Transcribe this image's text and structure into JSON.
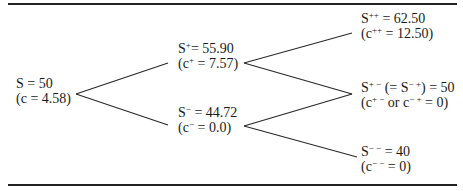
{
  "diagram": {
    "type": "binomial-tree",
    "nodes": [
      {
        "id": "root",
        "price_label": "S",
        "price_sup": "",
        "price_value": "50",
        "option_label": "c",
        "option_sup": "",
        "option_value": "4.58"
      },
      {
        "id": "up",
        "price_label": "S",
        "price_sup": "+",
        "price_value": "55.90",
        "option_label": "c",
        "option_sup": "+",
        "option_value": "7.57"
      },
      {
        "id": "down",
        "price_label": "S",
        "price_sup": "−",
        "price_value": "44.72",
        "option_label": "c",
        "option_sup": "−",
        "option_value": "0.0"
      },
      {
        "id": "up-up",
        "price_label": "S",
        "price_sup": "++",
        "price_value": "62.50",
        "option_label": "c",
        "option_sup": "++",
        "option_value": "12.50"
      },
      {
        "id": "up-down",
        "price_label": "S",
        "price_sup": "+ −",
        "price_alt_label": "S",
        "price_alt_sup": "− +",
        "price_value": "50",
        "option_label": "c",
        "option_sup": "+ −",
        "option_connector": "or",
        "option_alt_label": "c",
        "option_alt_sup": "− +",
        "option_value": "0"
      },
      {
        "id": "down-down",
        "price_label": "S",
        "price_sup": "− −",
        "price_value": "40",
        "option_label": "c",
        "option_sup": "− −",
        "option_value": "0"
      }
    ],
    "edges": [
      {
        "from": "root",
        "to": "up"
      },
      {
        "from": "root",
        "to": "down"
      },
      {
        "from": "up",
        "to": "up-up"
      },
      {
        "from": "up",
        "to": "up-down"
      },
      {
        "from": "down",
        "to": "up-down"
      },
      {
        "from": "down",
        "to": "down-down"
      }
    ]
  }
}
